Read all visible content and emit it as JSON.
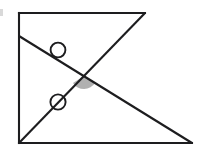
{
  "figure": {
    "canvas": {
      "width": 210,
      "height": 159,
      "background": "#ffffff"
    },
    "stroke_color": "#1d1d1f",
    "shade_color": "#9a9a9a",
    "points": {
      "top_left": {
        "x": 19,
        "y": 13
      },
      "top_right": {
        "x": 145,
        "y": 13
      },
      "bottom_left": {
        "x": 19,
        "y": 143
      },
      "bottom_right": {
        "x": 192,
        "y": 143
      },
      "left_mid": {
        "x": 19,
        "y": 36
      },
      "intersection": {
        "x": 84,
        "y": 76
      }
    },
    "segments": [
      {
        "name": "left-edge",
        "label": "left vertical edge",
        "x1": 19,
        "y1": 13,
        "x2": 19,
        "y2": 143
      },
      {
        "name": "top-edge",
        "label": "top horizontal edge",
        "x1": 19,
        "y1": 13,
        "x2": 145,
        "y2": 13
      },
      {
        "name": "bottom-edge",
        "label": "bottom horizontal edge",
        "x1": 19,
        "y1": 143,
        "x2": 192,
        "y2": 143
      },
      {
        "name": "diagonal-descending",
        "label": "descending transversal",
        "x1": 19,
        "y1": 36,
        "x2": 192,
        "y2": 143
      },
      {
        "name": "diagonal-ascending",
        "label": "ascending transversal",
        "x1": 19,
        "y1": 143,
        "x2": 145,
        "y2": 13
      }
    ],
    "tick_marks": [
      {
        "name": "upper-tick-circle",
        "cx": 58,
        "cy": 50,
        "r": 7.4,
        "on_segment": "diagonal-descending"
      },
      {
        "name": "lower-tick-circle",
        "cx": 58,
        "cy": 102,
        "r": 7.6,
        "on_segment": "diagonal-ascending"
      }
    ],
    "angle_mark": {
      "name": "shaded-angle",
      "cx": 84,
      "cy": 76,
      "r": 13,
      "start_deg": 31,
      "end_deg": 148,
      "fill": "#9a9a9a",
      "description": "shaded wedge marking the lower vertical angle at the crossing point"
    },
    "artifact": {
      "name": "left-edge-smudge",
      "x": 0,
      "y": 9,
      "width": 3,
      "height": 7
    }
  }
}
